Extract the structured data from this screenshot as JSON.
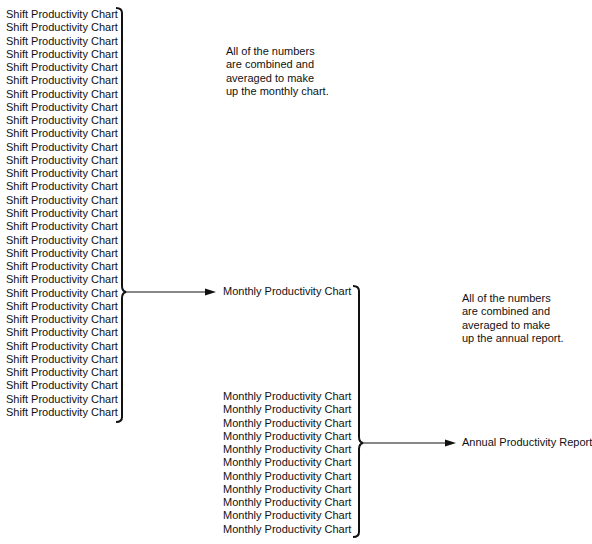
{
  "shift_charts": {
    "label": "Shift Productivity Chart",
    "count": 31,
    "items": [
      "Shift Productivity Chart",
      "Shift Productivity Chart",
      "Shift Productivity Chart",
      "Shift Productivity Chart",
      "Shift Productivity Chart",
      "Shift Productivity Chart",
      "Shift Productivity Chart",
      "Shift Productivity Chart",
      "Shift Productivity Chart",
      "Shift Productivity Chart",
      "Shift Productivity Chart",
      "Shift Productivity Chart",
      "Shift Productivity Chart",
      "Shift Productivity Chart",
      "Shift Productivity Chart",
      "Shift Productivity Chart",
      "Shift Productivity Chart",
      "Shift Productivity Chart",
      "Shift Productivity Chart",
      "Shift Productivity Chart",
      "Shift Productivity Chart",
      "Shift Productivity Chart",
      "Shift Productivity Chart",
      "Shift Productivity Chart",
      "Shift Productivity Chart",
      "Shift Productivity Chart",
      "Shift Productivity Chart",
      "Shift Productivity Chart",
      "Shift Productivity Chart",
      "Shift Productivity Chart",
      "Shift Productivity Chart"
    ]
  },
  "note_monthly": {
    "lines": [
      "All of the numbers",
      "are combined and",
      "averaged to make",
      "up the monthly chart."
    ]
  },
  "monthly_target": {
    "label": "Monthly Productivity Chart"
  },
  "monthly_charts": {
    "label": "Monthly Productivity Chart",
    "count": 11,
    "items": [
      "Monthly Productivity Chart",
      "Monthly Productivity Chart",
      "Monthly Productivity Chart",
      "Monthly Productivity Chart",
      "Monthly Productivity Chart",
      "Monthly Productivity Chart",
      "Monthly Productivity Chart",
      "Monthly Productivity Chart",
      "Monthly Productivity Chart",
      "Monthly Productivity Chart",
      "Monthly Productivity Chart"
    ]
  },
  "note_annual": {
    "lines": [
      "All of the numbers",
      "are combined and",
      "averaged to make",
      "up the annual report."
    ]
  },
  "annual_target": {
    "label": "Annual Productivity Report"
  },
  "colors": {
    "ink": "#111111",
    "background": "#ffffff"
  }
}
